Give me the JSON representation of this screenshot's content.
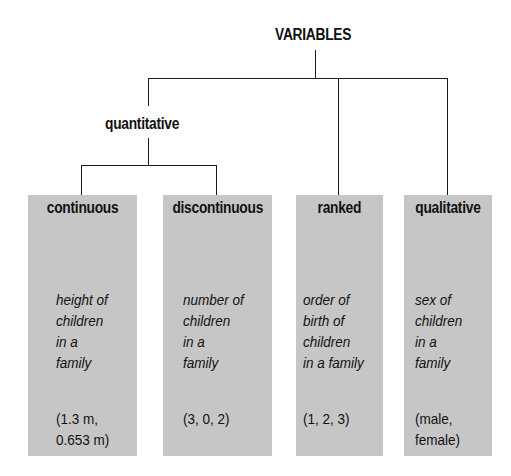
{
  "diagram": {
    "root": {
      "label": "VARIABLES"
    },
    "intermediate": {
      "label": "quantitative"
    },
    "categories": [
      {
        "label": "continuous",
        "description": "height of\nchildren\nin a\nfamily",
        "example": "(1.3 m,\n0.653 m)",
        "parent": "quantitative"
      },
      {
        "label": "discontinuous",
        "description": "number of\nchildren\nin a\nfamily",
        "example": "(3, 0, 2)",
        "parent": "quantitative"
      },
      {
        "label": "ranked",
        "description": "order of\nbirth of\nchildren\nin a family",
        "example": "(1, 2, 3)",
        "parent": "VARIABLES"
      },
      {
        "label": "qualitative",
        "description": "sex of\nchildren\nin a\nfamily",
        "example": "(male,\nfemale)",
        "parent": "VARIABLES"
      }
    ],
    "colors": {
      "box_fill": "#c6c6c6",
      "line": "#1a1a1a",
      "text": "#111111"
    }
  }
}
